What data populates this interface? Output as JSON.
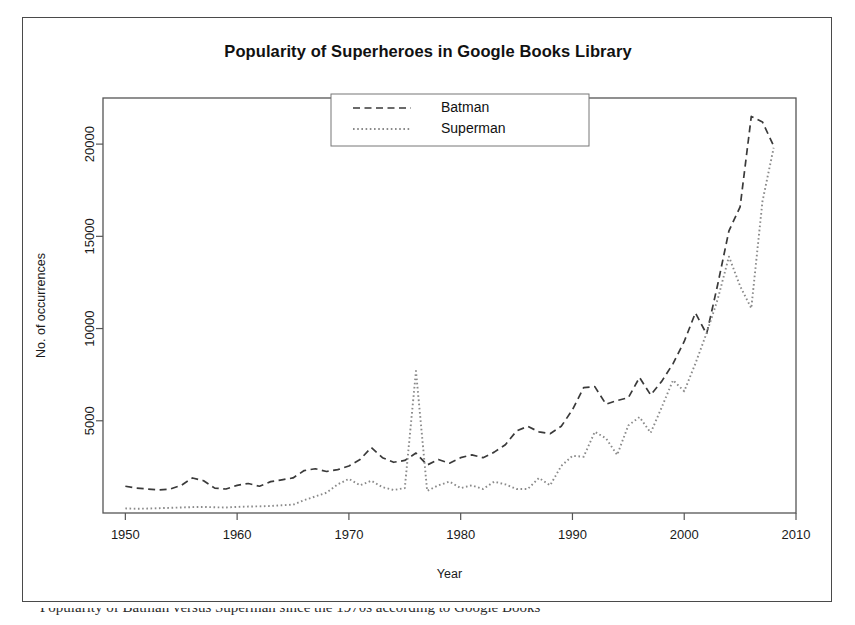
{
  "figure": {
    "title": "Popularity of Superheroes in Google Books Library",
    "caption_partial": "Popularity of Batman versus Superman since the 1970s according to Google Books"
  },
  "axes": {
    "x_label": "Year",
    "y_label": "No. of occurrences",
    "x_ticks": [
      "1950",
      "1960",
      "1970",
      "1980",
      "1990",
      "2000",
      "2010"
    ],
    "y_ticks": [
      "5000",
      "10000",
      "15000",
      "20000"
    ]
  },
  "legend": {
    "entries": [
      {
        "label": "Batman",
        "style": "dashed"
      },
      {
        "label": "Superman",
        "style": "dotted"
      }
    ]
  },
  "chart_data": {
    "type": "line",
    "title": "Popularity of Superheroes in Google Books Library",
    "xlabel": "Year",
    "ylabel": "No. of occurrences",
    "xlim": [
      1948,
      2010
    ],
    "ylim": [
      0,
      22500
    ],
    "grid": false,
    "legend_position": "top-center",
    "x": [
      1950,
      1951,
      1952,
      1953,
      1954,
      1955,
      1956,
      1957,
      1958,
      1959,
      1960,
      1961,
      1962,
      1963,
      1964,
      1965,
      1966,
      1967,
      1968,
      1969,
      1970,
      1971,
      1972,
      1973,
      1974,
      1975,
      1976,
      1977,
      1978,
      1979,
      1980,
      1981,
      1982,
      1983,
      1984,
      1985,
      1986,
      1987,
      1988,
      1989,
      1990,
      1991,
      1992,
      1993,
      1994,
      1995,
      1996,
      1997,
      1998,
      1999,
      2000,
      2001,
      2002,
      2003,
      2004,
      2005,
      2006,
      2007,
      2008
    ],
    "series": [
      {
        "name": "Batman",
        "style": "dashed",
        "color": "#3a3a3a",
        "values": [
          1450,
          1350,
          1300,
          1250,
          1300,
          1500,
          1900,
          1750,
          1350,
          1300,
          1500,
          1600,
          1450,
          1700,
          1800,
          1900,
          2300,
          2400,
          2250,
          2350,
          2550,
          2900,
          3550,
          3000,
          2750,
          2850,
          3250,
          2600,
          2900,
          2700,
          3000,
          3150,
          3000,
          3300,
          3700,
          4450,
          4700,
          4400,
          4300,
          4700,
          5600,
          6800,
          6850,
          5900,
          6100,
          6250,
          7350,
          6400,
          7150,
          8100,
          9300,
          10850,
          9700,
          12400,
          15300,
          16600,
          21500,
          21200,
          19900
        ]
      },
      {
        "name": "Superman",
        "style": "dotted",
        "color": "#8a8a8a",
        "values": [
          250,
          230,
          240,
          260,
          280,
          300,
          320,
          330,
          310,
          300,
          330,
          350,
          360,
          380,
          420,
          450,
          700,
          900,
          1100,
          1550,
          1850,
          1500,
          1750,
          1400,
          1250,
          1350,
          7700,
          1200,
          1500,
          1700,
          1350,
          1500,
          1300,
          1700,
          1550,
          1300,
          1300,
          1900,
          1500,
          2550,
          3100,
          3050,
          4400,
          4050,
          3150,
          4750,
          5200,
          4350,
          5750,
          7200,
          6600,
          8100,
          9750,
          11600,
          13900,
          12300,
          11100,
          16900,
          19800
        ]
      }
    ]
  }
}
